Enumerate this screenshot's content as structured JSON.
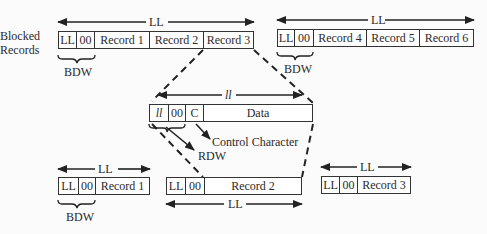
{
  "labels": {
    "blocked_records_line1": "Blocked",
    "blocked_records_line2": "Records",
    "ll": "LL",
    "ll_lower": "ll",
    "zero": "00",
    "bdw": "BDW",
    "rdw": "RDW",
    "control_character": "Control Character"
  },
  "top_left_block": {
    "fields": [
      "LL",
      "00",
      "Record 1",
      "Record 2",
      "Record 3"
    ]
  },
  "top_right_block": {
    "fields": [
      "LL",
      "00",
      "Record 4",
      "Record 5",
      "Record 6"
    ]
  },
  "record_detail": {
    "fields": [
      "ll",
      "00",
      "C",
      "Data"
    ]
  },
  "bottom_left_block": {
    "fields": [
      "LL",
      "00",
      "Record 1"
    ]
  },
  "bottom_middle_block": {
    "fields": [
      "LL",
      "00",
      "Record 2"
    ]
  },
  "bottom_right_block": {
    "fields": [
      "LL",
      "00",
      "Record 3"
    ]
  }
}
